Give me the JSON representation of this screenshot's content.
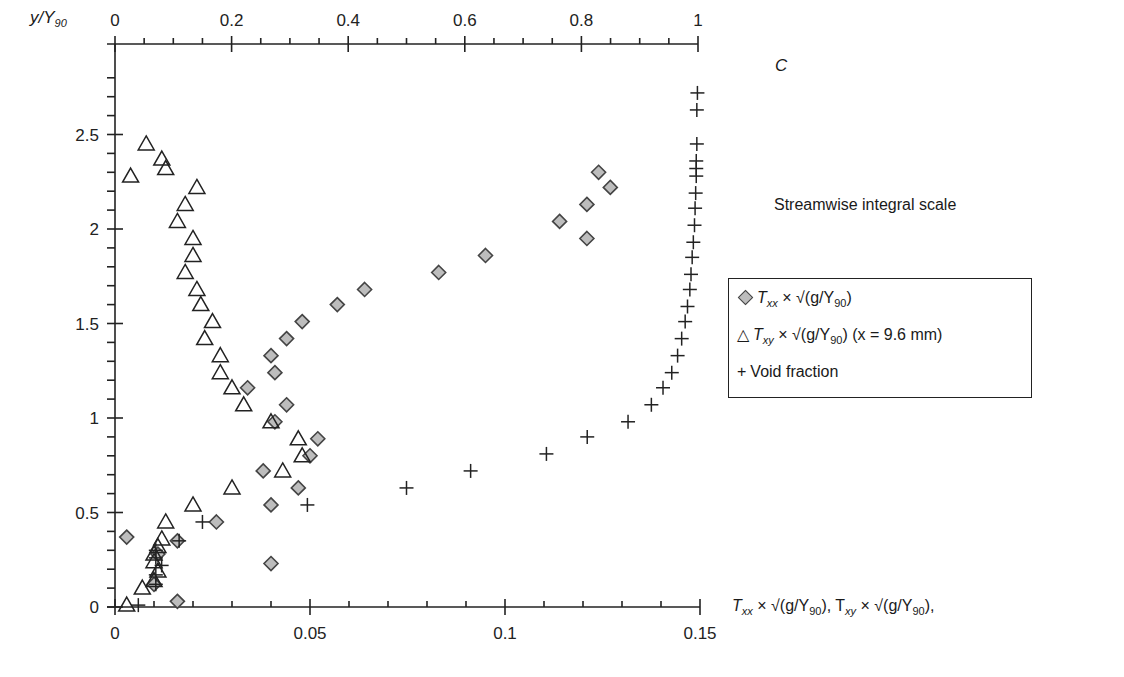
{
  "chart_data": {
    "type": "scatter",
    "title": "Streamwise integral scale",
    "ylabel": "y/Y90",
    "xlabel": "Txx × √(g/Y90), Txy × √(g/Y90),",
    "x2label": "C",
    "xlim": [
      0,
      0.15
    ],
    "x2lim": [
      0,
      1
    ],
    "ylim": [
      0,
      2.8
    ],
    "x_ticks": [
      "0",
      "0.05",
      "0.1",
      "0.15"
    ],
    "x2_ticks": [
      "0",
      "0.2",
      "0.4",
      "0.6",
      "0.8",
      "1"
    ],
    "y_ticks": [
      "0",
      "0.5",
      "1",
      "1.5",
      "2",
      "2.5"
    ],
    "grid": false,
    "legend_position": "right",
    "series": [
      {
        "name": "Txx × √(g/Y90)",
        "marker": "diamond",
        "axis": "bottom",
        "color": "#bdbdbd",
        "points": [
          [
            0.003,
            0.37
          ],
          [
            0.016,
            0.03
          ],
          [
            0.016,
            0.35
          ],
          [
            0.04,
            0.23
          ],
          [
            0.04,
            0.54
          ],
          [
            0.026,
            0.45
          ],
          [
            0.047,
            0.63
          ],
          [
            0.038,
            0.72
          ],
          [
            0.05,
            0.8
          ],
          [
            0.052,
            0.89
          ],
          [
            0.041,
            0.98
          ],
          [
            0.044,
            1.07
          ],
          [
            0.034,
            1.16
          ],
          [
            0.041,
            1.24
          ],
          [
            0.04,
            1.33
          ],
          [
            0.044,
            1.42
          ],
          [
            0.048,
            1.51
          ],
          [
            0.057,
            1.6
          ],
          [
            0.064,
            1.68
          ],
          [
            0.083,
            1.77
          ],
          [
            0.095,
            1.86
          ],
          [
            0.121,
            1.95
          ],
          [
            0.114,
            2.04
          ],
          [
            0.121,
            2.13
          ],
          [
            0.127,
            2.22
          ],
          [
            0.124,
            2.3
          ],
          [
            0.011,
            0.28
          ],
          [
            0.01,
            0.12
          ]
        ]
      },
      {
        "name": "Txy × √(g/Y90) (x = 9.6 mm)",
        "marker": "triangle",
        "axis": "bottom",
        "color": "#ffffff",
        "points": [
          [
            0.003,
            0.01
          ],
          [
            0.007,
            0.1
          ],
          [
            0.011,
            0.19
          ],
          [
            0.01,
            0.28
          ],
          [
            0.012,
            0.36
          ],
          [
            0.013,
            0.45
          ],
          [
            0.02,
            0.54
          ],
          [
            0.03,
            0.63
          ],
          [
            0.043,
            0.72
          ],
          [
            0.048,
            0.8
          ],
          [
            0.047,
            0.89
          ],
          [
            0.04,
            0.98
          ],
          [
            0.033,
            1.07
          ],
          [
            0.03,
            1.16
          ],
          [
            0.027,
            1.24
          ],
          [
            0.027,
            1.33
          ],
          [
            0.023,
            1.42
          ],
          [
            0.025,
            1.51
          ],
          [
            0.022,
            1.6
          ],
          [
            0.021,
            1.68
          ],
          [
            0.018,
            1.77
          ],
          [
            0.02,
            1.86
          ],
          [
            0.02,
            1.95
          ],
          [
            0.016,
            2.04
          ],
          [
            0.018,
            2.13
          ],
          [
            0.021,
            2.22
          ],
          [
            0.004,
            2.28
          ],
          [
            0.013,
            2.32
          ],
          [
            0.012,
            2.37
          ],
          [
            0.008,
            2.45
          ],
          [
            0.01,
            0.14
          ],
          [
            0.01,
            0.24
          ],
          [
            0.011,
            0.32
          ]
        ]
      },
      {
        "name": "Void fraction",
        "marker": "plus",
        "axis": "top",
        "color": "#222222",
        "points": [
          [
            0.04,
            0.01
          ],
          [
            0.07,
            0.12
          ],
          [
            0.07,
            0.17
          ],
          [
            0.08,
            0.22
          ],
          [
            0.07,
            0.26
          ],
          [
            0.07,
            0.3
          ],
          [
            0.11,
            0.35
          ],
          [
            0.15,
            0.45
          ],
          [
            0.33,
            0.54
          ],
          [
            0.5,
            0.63
          ],
          [
            0.61,
            0.72
          ],
          [
            0.74,
            0.81
          ],
          [
            0.81,
            0.9
          ],
          [
            0.88,
            0.98
          ],
          [
            0.92,
            1.07
          ],
          [
            0.94,
            1.16
          ],
          [
            0.955,
            1.24
          ],
          [
            0.965,
            1.33
          ],
          [
            0.972,
            1.42
          ],
          [
            0.978,
            1.51
          ],
          [
            0.982,
            1.59
          ],
          [
            0.986,
            1.68
          ],
          [
            0.988,
            1.76
          ],
          [
            0.99,
            1.85
          ],
          [
            0.992,
            1.93
          ],
          [
            0.994,
            2.02
          ],
          [
            0.995,
            2.11
          ],
          [
            0.996,
            2.19
          ],
          [
            0.997,
            2.28
          ],
          [
            0.997,
            2.32
          ],
          [
            0.997,
            2.36
          ],
          [
            0.998,
            2.45
          ],
          [
            0.998,
            2.63
          ],
          [
            0.999,
            2.72
          ]
        ]
      }
    ]
  },
  "labels": {
    "title": "Streamwise integral scale",
    "y_axis": "y/Y",
    "y_axis_sub": "90",
    "top_axis": "C",
    "bottom_axis_part1": "T",
    "bottom_axis_sub1": "xx",
    "bottom_axis_part2": " × √(g/Y",
    "bottom_axis_sub2": "90",
    "bottom_axis_part3": "), T",
    "bottom_axis_sub3": "xy",
    "bottom_axis_part4": " × √(g/Y",
    "bottom_axis_sub4": "90",
    "bottom_axis_part5": "),"
  },
  "legend": {
    "items": [
      {
        "symbol": "◇",
        "text_main": "T",
        "sub": "xx",
        "rest": " × √(g/Y",
        "sub2": "90",
        "tail": ")"
      },
      {
        "symbol": "△",
        "text_main": "T",
        "sub": "xy",
        "rest": " × √(g/Y",
        "sub2": "90",
        "tail": ") (x = 9.6 mm)"
      },
      {
        "symbol": "+",
        "text_main": "Void fraction"
      }
    ]
  }
}
